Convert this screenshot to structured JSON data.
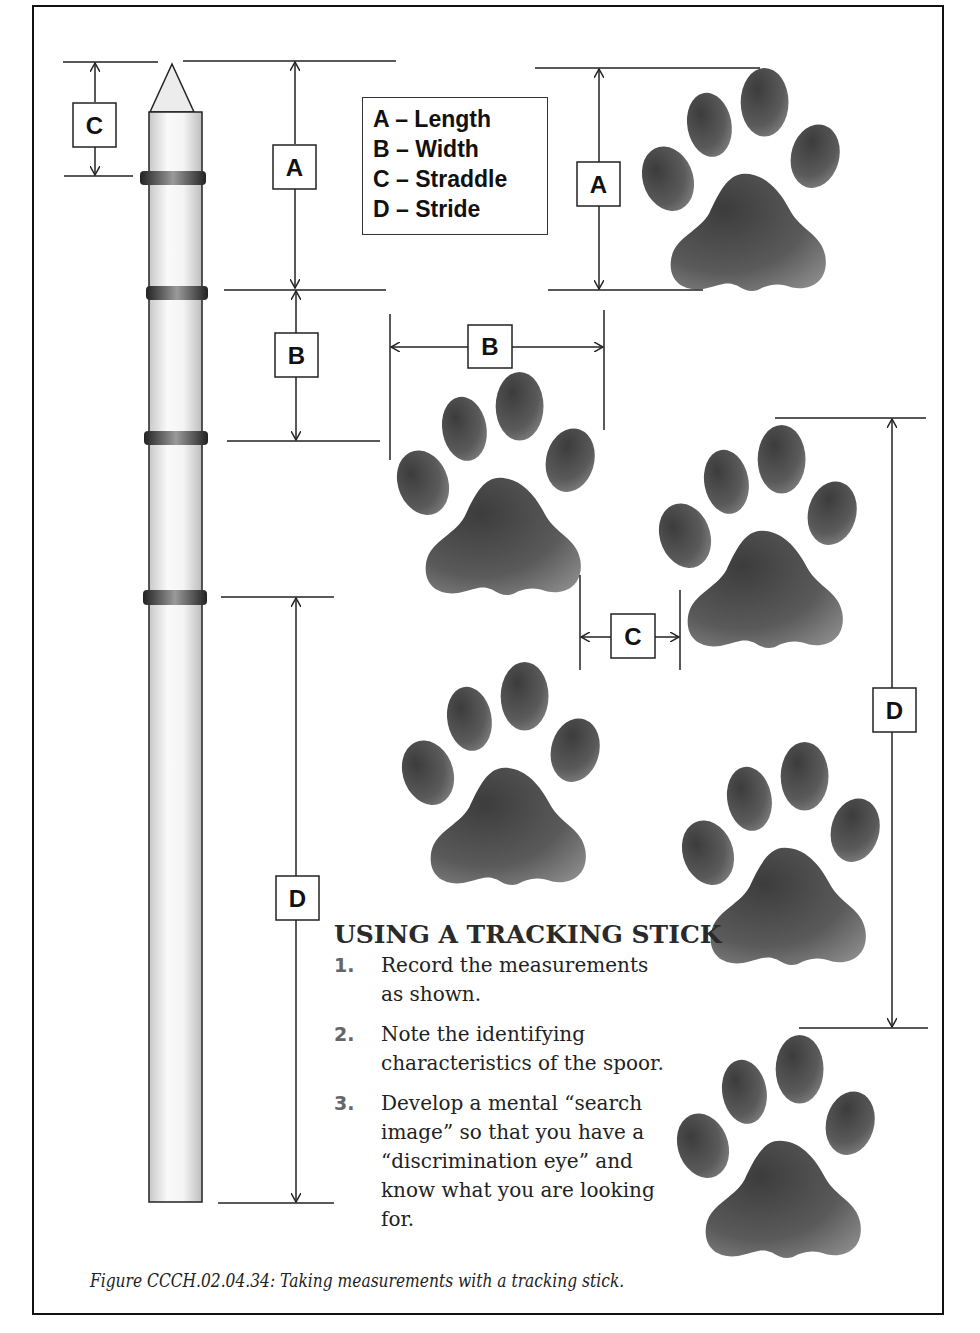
{
  "figure": {
    "caption": "Figure CCCH.02.04.34:  Taking measurements with a tracking stick."
  },
  "legend": {
    "items": [
      {
        "key": "A",
        "label": "A – Length"
      },
      {
        "key": "B",
        "label": "B – Width"
      },
      {
        "key": "C",
        "label": "C – Straddle"
      },
      {
        "key": "D",
        "label": "D – Stride"
      }
    ]
  },
  "stick_labels": {
    "c": "C",
    "a": "A",
    "b": "B",
    "d": "D"
  },
  "track_labels": {
    "a": "A",
    "b": "B",
    "c": "C",
    "d": "D"
  },
  "instructions": {
    "title": "USING A TRACKING STICK",
    "steps": [
      {
        "num": "1.",
        "text": "Record the measurements as shown."
      },
      {
        "num": "2.",
        "text": "Note the identifying characteristics of the spoor."
      },
      {
        "num": "3.",
        "text": "Develop a mental “search image” so that you have a “discrimination eye” and know what you are looking for."
      }
    ]
  },
  "colors": {
    "line": "#222222",
    "paw_dark": "#3a3a3a",
    "paw_light": "#8a8a8a",
    "stick_body": "#f0f0f0",
    "stick_band": "#333333"
  }
}
